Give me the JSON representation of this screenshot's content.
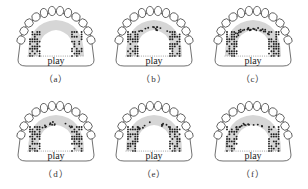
{
  "figure": {
    "panels": [
      {
        "id": "a",
        "caption": "（a）",
        "label": "play",
        "variant": "a"
      },
      {
        "id": "b",
        "caption": "（b）",
        "label": "play",
        "variant": "b"
      },
      {
        "id": "c",
        "caption": "（c）",
        "label": "play",
        "variant": "c"
      },
      {
        "id": "d",
        "caption": "（d）",
        "label": "play",
        "variant": "d"
      },
      {
        "id": "e",
        "caption": "（e）",
        "label": "play",
        "variant": "e"
      },
      {
        "id": "f",
        "caption": "（f）",
        "label": "play",
        "variant": "f"
      }
    ],
    "colors": {
      "outline": "#333333",
      "tooth_fill": "#ffffff",
      "active_dot": "#222222",
      "gray_band": "#bbbbbb",
      "light_dot": "#999999"
    }
  }
}
